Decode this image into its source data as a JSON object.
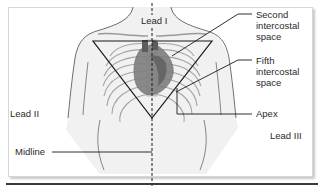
{
  "figure": {
    "labels": {
      "lead_i": "Lead I",
      "lead_ii": "Lead II",
      "lead_iii": "Lead III",
      "midline": "Midline",
      "apex": "Apex"
    },
    "callouts": {
      "second_intercostal": [
        "Second",
        "intercostal",
        "space"
      ],
      "fifth_intercostal": [
        "Fifth",
        "intercostal",
        "space"
      ]
    },
    "colors": {
      "line": "#1a1a1a",
      "ribs": "#9a9a9a",
      "heart_dark": "#5a5a5a",
      "heart_mid": "#7d7d7d",
      "torso_fill": "#f0f0f0",
      "frame_border": "#d6d6d6"
    }
  }
}
